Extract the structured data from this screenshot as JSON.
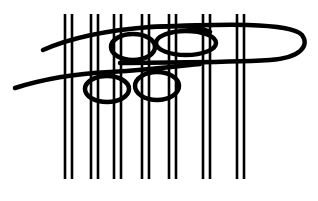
{
  "diagram": {
    "type": "weaving-knot-illustration",
    "colors": {
      "stroke": "#000000",
      "background": "#ffffff"
    },
    "warp_pairs": [
      {
        "x1": 65,
        "x2": 72
      },
      {
        "x1": 91,
        "x2": 98
      },
      {
        "x1": 114,
        "x2": 121
      },
      {
        "x1": 142,
        "x2": 149
      },
      {
        "x1": 169,
        "x2": 176
      },
      {
        "x1": 203,
        "x2": 210
      },
      {
        "x1": 237,
        "x2": 244
      }
    ],
    "warp_top": 14,
    "warp_bottom": 179,
    "weft_strands": [
      {
        "name": "upper-weft",
        "loops": 2,
        "ends_in_loop_right": true
      },
      {
        "name": "lower-weft",
        "loops": 2
      }
    ]
  }
}
